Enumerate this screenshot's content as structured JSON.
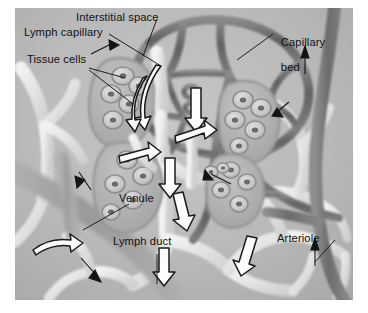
{
  "figure": {
    "kind": "anatomical-illustration",
    "background_color": "#b9b9b9",
    "border_color": "#ffffff"
  },
  "labels": {
    "interstitial_space": "Interstitial space",
    "lymph_capillary": "Lymph capillary",
    "tissue_cells": "Tissue cells",
    "capillary_bed_line1": "Capillary",
    "capillary_bed_line2": "bed",
    "venule": "Venule",
    "lymph_duct": "Lymph duct",
    "arteriole": "Arteriole"
  },
  "colors": {
    "background": "#b9b9b9",
    "capillary_dark": "#6f6f6f",
    "capillary_darker": "#585858",
    "lymph_pale": "#e4e4e4",
    "lymph_light": "#efefef",
    "venule_grey": "#a2a2a2",
    "arteriole_dark": "#7a7a7a",
    "cell_fill": "#cfcfcf",
    "nucleus": "#6a6a6a",
    "arrow_fill": "#fdfdfd",
    "arrow_outline": "#1a1a1a",
    "text": "#111111",
    "leader_line": "#1e1e1e"
  },
  "structures": {
    "capillary_bed": "dark polygonal mesh of anastomosing capillary loops, upper center-right",
    "lymph_capillary": "pale blind-ended lymphatic vessels among tissue cell lobes",
    "tissue_cells": "rounded cells with dark nuclei grouped inside lobular outlines",
    "lymph_duct": "pale branching lymphatic duct network, lower center and right",
    "venule": "broad grey vessel crossing diagonally at lower left",
    "arteriole": "dark vessel running vertically along the right edge"
  },
  "flow_arrows": {
    "white_block_arrows": "hollow white black-outlined arrows indicating lymph flow",
    "white_count": 10,
    "black_thin_arrows": "small solid black arrows indicating blood flow direction",
    "black_count": 6
  }
}
